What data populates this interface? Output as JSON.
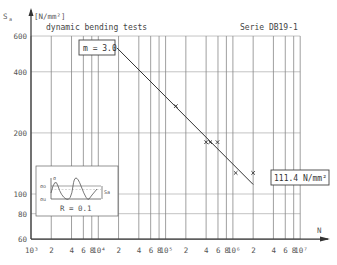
{
  "chart_data": {
    "type": "scatter",
    "title": "dynamic bending tests",
    "subtitle": "Serie DB19-1",
    "xlabel": "N",
    "ylabel": "S_a [N/mm²]",
    "y_symbol": "S",
    "y_subscript": "a",
    "y_unit": "[N/mm²]",
    "xscale": "log",
    "yscale": "log",
    "xlim": [
      1000,
      10000000
    ],
    "ylim": [
      60,
      600
    ],
    "grid": true,
    "yticks": [
      60,
      80,
      100,
      200,
      400,
      600
    ],
    "ytick_labels": [
      "60",
      "80",
      "100",
      "200",
      "400",
      "600"
    ],
    "xtick_labels": [
      {
        "v": 1000,
        "t": "10³"
      },
      {
        "v": 2000,
        "t": "2"
      },
      {
        "v": 4000,
        "t": "4"
      },
      {
        "v": 6000,
        "t": "6"
      },
      {
        "v": 8000,
        "t": "8"
      },
      {
        "v": 10000,
        "t": "10⁴"
      },
      {
        "v": 20000,
        "t": "2"
      },
      {
        "v": 40000,
        "t": "4"
      },
      {
        "v": 60000,
        "t": "6"
      },
      {
        "v": 80000,
        "t": "8"
      },
      {
        "v": 100000,
        "t": "10⁵"
      },
      {
        "v": 200000,
        "t": "2"
      },
      {
        "v": 400000,
        "t": "4"
      },
      {
        "v": 600000,
        "t": "6"
      },
      {
        "v": 800000,
        "t": "8"
      },
      {
        "v": 1000000,
        "t": "10⁶"
      },
      {
        "v": 2000000,
        "t": "2"
      },
      {
        "v": 4000000,
        "t": "4"
      },
      {
        "v": 6000000,
        "t": "6"
      },
      {
        "v": 8000000,
        "t": "8"
      },
      {
        "v": 10000000,
        "t": "10⁷"
      }
    ],
    "series": [
      {
        "name": "test results",
        "marker": "x",
        "points": [
          {
            "N": 142000,
            "S": 271
          },
          {
            "N": 400000,
            "S": 180
          },
          {
            "N": 460000,
            "S": 180
          },
          {
            "N": 590000,
            "S": 180
          },
          {
            "N": 1100000,
            "S": 127
          },
          {
            "N": 2000000,
            "S": 127
          }
        ]
      },
      {
        "name": "S-N regression line",
        "type": "line",
        "slope_m": 3.0,
        "points": [
          {
            "N": 19000,
            "S": 524
          },
          {
            "N": 2000000,
            "S": 111.4
          }
        ]
      }
    ],
    "annotations": [
      {
        "text": "m = 3.0",
        "type": "box"
      },
      {
        "text": "111.4 N/mm²",
        "type": "box"
      },
      {
        "text": "R = 0.1",
        "type": "inset-caption"
      }
    ],
    "inset": {
      "description": "sinusoidal load cycle schematic",
      "labels": {
        "axis": "σ",
        "upper": "σo",
        "lower": "σu",
        "amplitude": "Sa"
      },
      "caption": "R = 0.1"
    }
  },
  "labels": {
    "title": "dynamic bending tests",
    "series_name": "Serie DB19-1",
    "y_axis_symbol": "S",
    "y_axis_sub": "a",
    "y_axis_unit": "[N/mm²]",
    "x_axis": "N",
    "slope_box": "m = 3.0",
    "endurance_box": "111.4 N/mm²",
    "inset_caption": "R = 0.1",
    "inset_sigma": "σ",
    "inset_sigma_o": "σo",
    "inset_sigma_u": "σu",
    "inset_sa": "Sa"
  }
}
